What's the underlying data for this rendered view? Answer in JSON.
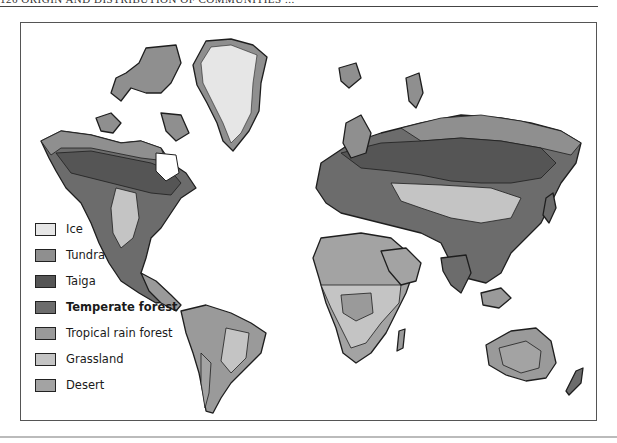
{
  "page": {
    "running_head": "126   ORIGIN AND DISTRIBUTION OF COMMUNITIES   ...",
    "page_number": "126"
  },
  "map": {
    "title": "World biome map",
    "colors": {
      "ice": "#e6e6e6",
      "tundra": "#8f8f8f",
      "taiga": "#555555",
      "temperate_forest": "#6c6c6c",
      "tropical_rain_forest": "#9a9a9a",
      "grassland": "#c4c4c4",
      "desert": "#a3a3a3",
      "outline": "#1e1e1e"
    }
  },
  "legend": {
    "items": [
      {
        "label": "Ice",
        "color": "#e6e6e6",
        "bold": false
      },
      {
        "label": "Tundra",
        "color": "#8f8f8f",
        "bold": false
      },
      {
        "label": "Taiga",
        "color": "#555555",
        "bold": false
      },
      {
        "label": "Temperate forest",
        "color": "#6c6c6c",
        "bold": true
      },
      {
        "label": "Tropical rain forest",
        "color": "#9a9a9a",
        "bold": false
      },
      {
        "label": "Grassland",
        "color": "#c4c4c4",
        "bold": false
      },
      {
        "label": "Desert",
        "color": "#a3a3a3",
        "bold": false
      }
    ]
  }
}
